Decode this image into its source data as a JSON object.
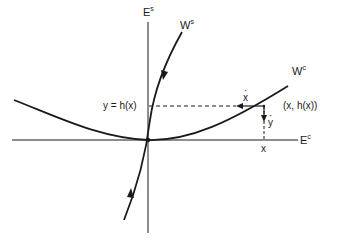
{
  "diagram": {
    "type": "center-manifold-phase-portrait",
    "axes": {
      "vertical": {
        "label": "E",
        "superscript": "s"
      },
      "horizontal": {
        "label": "E",
        "superscript": "c"
      }
    },
    "curves": {
      "stable_manifold": {
        "label": "W",
        "superscript": "s"
      },
      "center_manifold": {
        "label": "W",
        "superscript": "c"
      }
    },
    "annotations": {
      "y_level": "y = h(x)",
      "point": "(x, h(x))",
      "x_tick": "x",
      "x_dot": "x",
      "y_dot": "y"
    },
    "colors": {
      "stroke": "#1a1a1a",
      "background": "#ffffff"
    }
  }
}
